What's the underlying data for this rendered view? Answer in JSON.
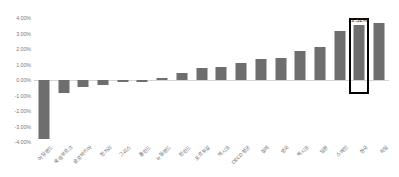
{
  "chart_data": {
    "type": "bar",
    "title": "",
    "subtitle": "",
    "xlabel": "",
    "ylabel": "",
    "ylim": [
      -4.0,
      4.0
    ],
    "grid": false,
    "legend": null,
    "legend_position": "none",
    "y_ticks": [
      "4.00%",
      "3.00%",
      "2.00%",
      "1.00%",
      "0.00%",
      "-1.00%",
      "-2.00%",
      "-3.00%",
      "-4.00%"
    ],
    "y_tick_values": [
      4.0,
      3.0,
      2.0,
      1.0,
      0.0,
      -1.0,
      -2.0,
      -3.0,
      -4.0
    ],
    "bar_color": "#6e6e6e",
    "highlight_color": "#000000",
    "zero_line_color": "#d4d4d4",
    "categories": [
      "아일랜드",
      "룩셈부르크",
      "슬로바키아",
      "헝가리",
      "그리스",
      "폴란드",
      "뉴질랜드",
      "핀란드",
      "포르투갈",
      "멕시코",
      "OECD 평균",
      "칠레",
      "영국",
      "멕시코",
      "일본",
      "스페인",
      "한국",
      "독일"
    ],
    "values": [
      -3.78,
      -0.85,
      -0.45,
      -0.33,
      -0.15,
      -0.14,
      0.1,
      0.42,
      0.8,
      0.82,
      1.1,
      1.33,
      1.45,
      1.88,
      2.15,
      3.18,
      3.52,
      3.7
    ],
    "annotations": [
      {
        "category_index": 16,
        "label": "3.52%",
        "highlighted": true,
        "highlight_shape": "rectangle-outline"
      }
    ]
  }
}
